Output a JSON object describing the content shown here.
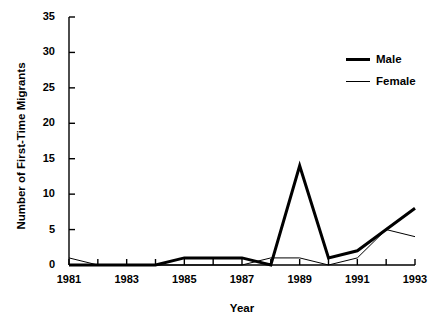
{
  "chart_data": {
    "type": "line",
    "title": "",
    "xlabel": "Year",
    "ylabel": "Number of First-Time Migrants",
    "x": [
      1981,
      1982,
      1983,
      1984,
      1985,
      1986,
      1987,
      1988,
      1989,
      1990,
      1991,
      1992,
      1993
    ],
    "xlim": [
      1981,
      1993
    ],
    "ylim": [
      0,
      35
    ],
    "xticks": [
      1981,
      1982,
      1983,
      1984,
      1985,
      1986,
      1987,
      1988,
      1989,
      1990,
      1991,
      1992,
      1993
    ],
    "xtick_labels_shown": [
      "1981",
      "1983",
      "1985",
      "1987",
      "1989",
      "1991",
      "1993"
    ],
    "yticks": [
      0,
      5,
      10,
      15,
      20,
      25,
      30,
      35
    ],
    "ytick_labels": [
      "0",
      "5",
      "10",
      "15",
      "20",
      "25",
      "30",
      "35"
    ],
    "grid": false,
    "legend_position": "top-right",
    "series": [
      {
        "name": "Male",
        "color": "#000000",
        "line_width": 3,
        "values": [
          0,
          0,
          0,
          0,
          1,
          1,
          1,
          0,
          14,
          1,
          2,
          5,
          8
        ]
      },
      {
        "name": "Female",
        "color": "#000000",
        "line_width": 1,
        "values": [
          1,
          0,
          0,
          0,
          0,
          0,
          0,
          1,
          1,
          0,
          1,
          5,
          4
        ]
      }
    ]
  },
  "axes": {
    "y_label": "Number of First-Time Migrants",
    "x_label": "Year",
    "y_ticks": [
      {
        "value": 35,
        "label": "35"
      },
      {
        "value": 30,
        "label": "30"
      },
      {
        "value": 25,
        "label": "25"
      },
      {
        "value": 20,
        "label": "20"
      },
      {
        "value": 15,
        "label": "15"
      },
      {
        "value": 10,
        "label": "10"
      },
      {
        "value": 5,
        "label": "5"
      },
      {
        "value": 0,
        "label": "0"
      }
    ],
    "x_ticks": [
      {
        "value": 1981,
        "label": "1981"
      },
      {
        "value": 1983,
        "label": "1983"
      },
      {
        "value": 1985,
        "label": "1985"
      },
      {
        "value": 1987,
        "label": "1987"
      },
      {
        "value": 1989,
        "label": "1989"
      },
      {
        "value": 1991,
        "label": "1991"
      },
      {
        "value": 1993,
        "label": "1993"
      }
    ]
  },
  "legend": {
    "items": [
      {
        "label": "Male",
        "style": "thick"
      },
      {
        "label": "Female",
        "style": "thin"
      }
    ]
  },
  "colors": {
    "axis": "#000000",
    "series": "#000000",
    "background": "#ffffff"
  }
}
